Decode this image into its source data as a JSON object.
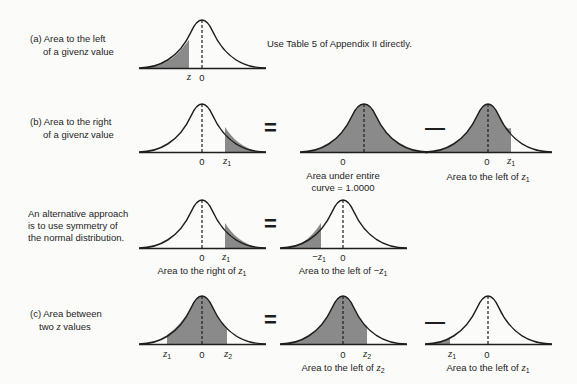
{
  "rows": {
    "a": {
      "label_line1": "(a) Area to the left",
      "label_line2": "of a given z value",
      "note": "Use Table 5 of Appendix II directly.",
      "curve": {
        "shade": "left",
        "ticks": [
          "z",
          "0"
        ]
      }
    },
    "b": {
      "label_line1": "(b) Area to the right",
      "label_line2": "of a given z value",
      "op1": "=",
      "op2": "—",
      "curve1": {
        "shade": "right",
        "ticks": [
          "0",
          "z1"
        ]
      },
      "curve2": {
        "shade": "all",
        "ticks": [
          "0"
        ],
        "caption_line1": "Area under entire",
        "caption_line2": "curve = 1.0000"
      },
      "curve3": {
        "shade": "left",
        "ticks": [
          "0",
          "z1"
        ],
        "caption": "Area to the left of z1"
      }
    },
    "alt": {
      "label_line1": "An alternative approach",
      "label_line2": "is to use symmetry of",
      "label_line3": "the normal distribution.",
      "op1": "=",
      "curve1": {
        "shade": "right",
        "ticks": [
          "0",
          "z1"
        ],
        "caption": "Area to the right of z1"
      },
      "curve2": {
        "shade": "left",
        "ticks": [
          "−z1",
          "0"
        ],
        "caption": "Area to the left of −z1"
      }
    },
    "c": {
      "label_line1": "(c) Area between",
      "label_line2": "two z values",
      "op1": "=",
      "op2": "—",
      "curve1": {
        "shade": "between",
        "ticks": [
          "z1",
          "0",
          "z2"
        ]
      },
      "curve2": {
        "shade": "left",
        "ticks": [
          "0",
          "z2"
        ],
        "caption": "Area to the left of z2"
      },
      "curve3": {
        "shade": "left",
        "ticks": [
          "z1",
          "0"
        ],
        "caption": "Area to the left of z1"
      }
    }
  },
  "text": {
    "z": "z",
    "zero": "0",
    "one": "1",
    "two": "2",
    "minus": "−",
    "area_left_of": "Area to the left of ",
    "area_right_of": "Area to the right of ",
    "a_label1": "(a) Area to the left",
    "a_label2_pre": "of a given",
    "a_label2_post": " value",
    "b_label1": "(b) Area to the right",
    "c_label1": "(c) Area between",
    "c_label2_pre": "two ",
    "c_label2_post": " values"
  },
  "colors": {
    "shade": "#8a8a8a",
    "line": "#1e1e1e",
    "background": "#fbfbf9"
  }
}
